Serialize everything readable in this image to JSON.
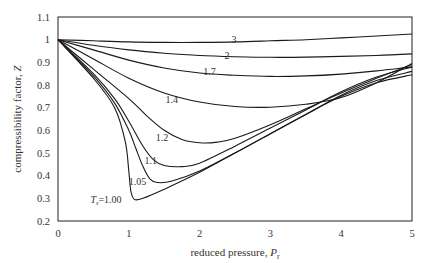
{
  "chart_data": {
    "type": "line",
    "title": "",
    "xlabel": "reduced pressure, P_r",
    "xlabel_main": "reduced pressure, ",
    "xlabel_symbol": "P",
    "xlabel_sub": "r",
    "ylabel": "compressibility factor, Z",
    "ylabel_main": "compressibility factor, ",
    "ylabel_symbol": "Z",
    "xlim": [
      0,
      5
    ],
    "ylim": [
      0.2,
      1.1
    ],
    "x_ticks": [
      "0",
      "1",
      "2",
      "3",
      "4",
      "5"
    ],
    "y_ticks": [
      "1.1",
      "1",
      "0.9",
      "0.8",
      "0.7",
      "0.6",
      "0.5",
      "0.4",
      "0.3",
      "0.2"
    ],
    "grid": false,
    "legend": "inline curve labels",
    "series": [
      {
        "name": "3",
        "label": "3",
        "label_pos": [
          2.45,
          1.0
        ],
        "x": [
          0,
          0.5,
          1,
          1.5,
          2,
          2.5,
          3,
          3.5,
          4,
          4.5,
          5
        ],
        "y": [
          1.0,
          0.995,
          0.99,
          0.988,
          0.988,
          0.99,
          0.995,
          1.0,
          1.008,
          1.016,
          1.025
        ]
      },
      {
        "name": "2",
        "label": "2",
        "label_pos": [
          2.35,
          0.93
        ],
        "x": [
          0,
          0.5,
          1,
          1.5,
          2,
          2.5,
          3,
          3.5,
          4,
          4.5,
          5
        ],
        "y": [
          1.0,
          0.975,
          0.955,
          0.94,
          0.93,
          0.925,
          0.922,
          0.923,
          0.926,
          0.93,
          0.937
        ]
      },
      {
        "name": "1.7",
        "label": "1.7",
        "label_pos": [
          2.05,
          0.86
        ],
        "x": [
          0,
          0.5,
          1,
          1.5,
          2,
          2.5,
          3,
          3.5,
          4,
          4.5,
          5
        ],
        "y": [
          1.0,
          0.955,
          0.91,
          0.875,
          0.853,
          0.843,
          0.838,
          0.84,
          0.848,
          0.862,
          0.88
        ]
      },
      {
        "name": "1.4",
        "label": "1.4",
        "label_pos": [
          1.52,
          0.735
        ],
        "x": [
          0,
          0.5,
          1,
          1.5,
          2,
          2.5,
          3,
          3.5,
          4,
          4.5,
          5
        ],
        "y": [
          1.0,
          0.915,
          0.83,
          0.765,
          0.725,
          0.705,
          0.702,
          0.715,
          0.745,
          0.81,
          0.895
        ]
      },
      {
        "name": "1.2",
        "label": "1.2",
        "label_pos": [
          1.38,
          0.57
        ],
        "x": [
          0,
          0.5,
          1,
          1.25,
          1.5,
          1.75,
          2,
          2.25,
          2.5,
          3,
          3.5,
          4,
          4.5,
          5
        ],
        "y": [
          1.0,
          0.87,
          0.74,
          0.665,
          0.6,
          0.56,
          0.545,
          0.548,
          0.565,
          0.625,
          0.695,
          0.765,
          0.83,
          0.89
        ]
      },
      {
        "name": "1.1",
        "label": "1.1",
        "label_pos": [
          1.22,
          0.465
        ],
        "x": [
          0,
          0.5,
          0.8,
          1,
          1.2,
          1.35,
          1.5,
          1.75,
          2,
          2.5,
          3,
          3.5,
          4,
          4.5,
          5
        ],
        "y": [
          1.0,
          0.85,
          0.74,
          0.64,
          0.53,
          0.47,
          0.445,
          0.44,
          0.455,
          0.53,
          0.61,
          0.69,
          0.77,
          0.835,
          0.88
        ]
      },
      {
        "name": "1.05",
        "label": "1.05",
        "label_pos": [
          1.0,
          0.375
        ],
        "x": [
          0,
          0.5,
          0.8,
          1,
          1.1,
          1.2,
          1.3,
          1.4,
          1.6,
          2,
          2.5,
          3,
          3.5,
          4,
          4.5,
          5
        ],
        "y": [
          1.0,
          0.84,
          0.72,
          0.6,
          0.52,
          0.44,
          0.385,
          0.37,
          0.375,
          0.42,
          0.5,
          0.585,
          0.67,
          0.755,
          0.82,
          0.86
        ]
      },
      {
        "name": "Tr=1.00",
        "label": "T_r=1.00",
        "label_pos": [
          0.46,
          0.295
        ],
        "x": [
          0,
          0.5,
          0.8,
          0.95,
          1.0,
          1.03,
          1.08,
          1.2,
          1.5,
          2,
          2.5,
          3,
          3.5,
          4,
          4.5,
          5
        ],
        "y": [
          1.0,
          0.83,
          0.7,
          0.55,
          0.42,
          0.33,
          0.295,
          0.3,
          0.34,
          0.415,
          0.5,
          0.585,
          0.67,
          0.75,
          0.81,
          0.845
        ]
      }
    ]
  }
}
